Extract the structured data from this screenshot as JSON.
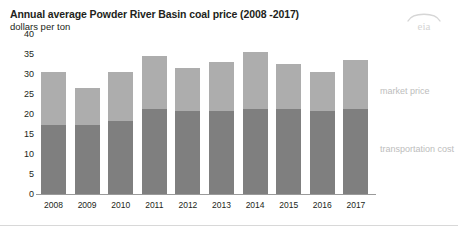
{
  "header": {
    "title": "Annual average Powder River Basin coal price (2008 -2017)",
    "subtitle": "dollars per ton",
    "logo_text": "eia"
  },
  "legend": {
    "market_price_label": "market price",
    "transportation_cost_label": "transportation cost"
  },
  "axis": {
    "y_ticks": [
      "40",
      "35",
      "30",
      "25",
      "20",
      "15",
      "10",
      "5",
      "0"
    ]
  },
  "chart_data": {
    "type": "bar",
    "stacked": true,
    "title": "Annual average Powder River Basin coal price (2008 -2017)",
    "subtitle": "dollars per ton",
    "xlabel": "",
    "ylabel": "dollars per ton",
    "ylim": [
      0,
      40
    ],
    "ytick_step": 5,
    "grid": false,
    "legend_position": "right",
    "categories": [
      "2008",
      "2009",
      "2010",
      "2011",
      "2012",
      "2013",
      "2014",
      "2015",
      "2016",
      "2017"
    ],
    "series": [
      {
        "name": "transportation cost",
        "color": "#7f7f7f",
        "values": [
          17.0,
          17.0,
          18.0,
          21.0,
          20.5,
          20.5,
          21.0,
          21.0,
          20.5,
          21.0
        ]
      },
      {
        "name": "market price",
        "color": "#adadad",
        "values": [
          13.0,
          9.0,
          12.0,
          13.0,
          10.5,
          12.0,
          14.0,
          11.0,
          9.5,
          12.0
        ]
      }
    ],
    "totals": [
      30.0,
      26.0,
      30.0,
      34.0,
      31.0,
      32.5,
      35.0,
      32.0,
      30.0,
      33.0
    ],
    "colors": {
      "market_price": "#adadad",
      "transportation_cost": "#7f7f7f",
      "text": "#231f20",
      "legend_text": "#bdbdbd",
      "axis": "#9a9a9a"
    }
  }
}
